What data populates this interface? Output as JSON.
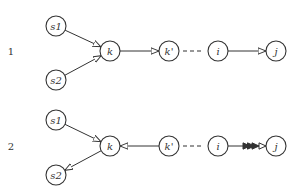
{
  "diagrams": [
    {
      "label": "1",
      "label_pos": [
        11,
        51
      ],
      "nodes": [
        {
          "id": "s1",
          "text": "s1",
          "x": 56,
          "y": 26
        },
        {
          "id": "s2",
          "text": "s2",
          "x": 56,
          "y": 80
        },
        {
          "id": "k",
          "text": "k",
          "x": 110,
          "y": 51
        },
        {
          "id": "kp",
          "text": "k'",
          "x": 169,
          "y": 51
        },
        {
          "id": "i",
          "text": "i",
          "x": 218,
          "y": 51
        },
        {
          "id": "j",
          "text": "j",
          "x": 276,
          "y": 51
        }
      ],
      "edges": [
        {
          "from": "s1",
          "to": "k",
          "style": "solid",
          "arrow": "open-triangle"
        },
        {
          "from": "s2",
          "to": "k",
          "style": "solid",
          "arrow": "open-triangle"
        },
        {
          "from": "k",
          "to": "kp",
          "style": "solid",
          "arrow": "open-triangle"
        },
        {
          "from": "kp",
          "to": "i",
          "style": "dashed",
          "arrow": "none"
        },
        {
          "from": "i",
          "to": "j",
          "style": "solid",
          "arrow": "open-triangle"
        }
      ]
    },
    {
      "label": "2",
      "label_pos": [
        11,
        146
      ],
      "nodes": [
        {
          "id": "s1",
          "text": "s1",
          "x": 56,
          "y": 120
        },
        {
          "id": "s2",
          "text": "s2",
          "x": 56,
          "y": 175
        },
        {
          "id": "k",
          "text": "k",
          "x": 110,
          "y": 146
        },
        {
          "id": "kp",
          "text": "k'",
          "x": 169,
          "y": 146
        },
        {
          "id": "i",
          "text": "i",
          "x": 218,
          "y": 146
        },
        {
          "id": "j",
          "text": "j",
          "x": 276,
          "y": 146
        }
      ],
      "edges": [
        {
          "from": "s1",
          "to": "k",
          "style": "solid",
          "arrow": "open-triangle"
        },
        {
          "from": "k",
          "to": "s2",
          "style": "solid",
          "arrow": "open-triangle"
        },
        {
          "from": "kp",
          "to": "k",
          "style": "solid",
          "arrow": "open-triangle"
        },
        {
          "from": "kp",
          "to": "i",
          "style": "dashed",
          "arrow": "none"
        },
        {
          "from": "i",
          "to": "j",
          "style": "solid",
          "arrow": "triple-filled-then-open"
        }
      ]
    }
  ],
  "node_radius": 10,
  "colors": {
    "stroke": "#333333",
    "background": "#ffffff"
  }
}
